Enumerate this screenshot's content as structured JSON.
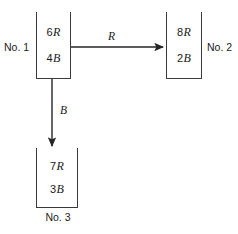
{
  "diagram": {
    "stroke_color": "#3a3a3a",
    "text_color": "#1a1a1a",
    "background": "#ffffff"
  },
  "urns": [
    {
      "id": "urn1",
      "name": "No. 1",
      "contents": [
        {
          "count": "6",
          "symbol": "R"
        },
        {
          "count": "4",
          "symbol": "B"
        }
      ]
    },
    {
      "id": "urn2",
      "name": "No. 2",
      "contents": [
        {
          "count": "8",
          "symbol": "R"
        },
        {
          "count": "2",
          "symbol": "B"
        }
      ]
    },
    {
      "id": "urn3",
      "name": "No. 3",
      "contents": [
        {
          "count": "7",
          "symbol": "R"
        },
        {
          "count": "3",
          "symbol": "B"
        }
      ]
    }
  ],
  "arrows": [
    {
      "id": "arrow-r",
      "label": "R",
      "from": "No. 1",
      "to": "No. 2",
      "direction": "right"
    },
    {
      "id": "arrow-b",
      "label": "B",
      "from": "No. 1",
      "to": "No. 3",
      "direction": "down"
    }
  ]
}
